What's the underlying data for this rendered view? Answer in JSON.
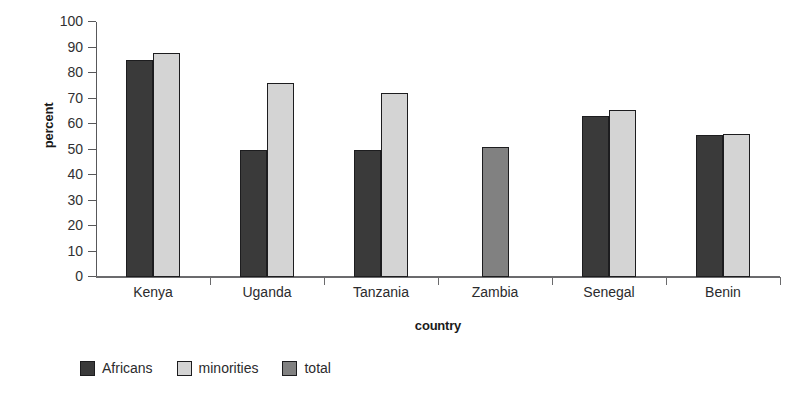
{
  "chart_data": {
    "type": "bar",
    "title": "",
    "subtitle": "",
    "xlabel": "country",
    "ylabel": "percent",
    "ylim": [
      0,
      100
    ],
    "yticks": [
      0,
      10,
      20,
      30,
      40,
      50,
      60,
      70,
      80,
      90,
      100
    ],
    "grid": false,
    "legend_position": "bottom-left",
    "categories": [
      "Kenya",
      "Uganda",
      "Tanzania",
      "Zambia",
      "Senegal",
      "Benin"
    ],
    "series": [
      {
        "name": "Africans",
        "color": "#3a3a3a",
        "values": [
          85,
          50,
          50,
          null,
          63,
          55.5
        ]
      },
      {
        "name": "minorities",
        "color": "#d4d4d4",
        "values": [
          88,
          76,
          72,
          null,
          65.5,
          56
        ]
      },
      {
        "name": "total",
        "color": "#818181",
        "values": [
          null,
          null,
          null,
          51,
          null,
          null
        ]
      }
    ]
  },
  "legend": {
    "entries": [
      {
        "label": "Africans",
        "color": "#3a3a3a",
        "swatch_name": "legend-swatch-africans"
      },
      {
        "label": "minorities",
        "color": "#d4d4d4",
        "swatch_name": "legend-swatch-minorities"
      },
      {
        "label": "total",
        "color": "#818181",
        "swatch_name": "legend-swatch-total"
      }
    ]
  }
}
